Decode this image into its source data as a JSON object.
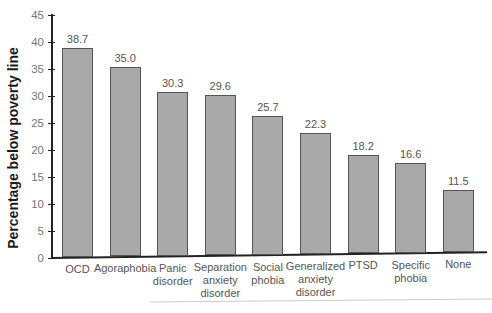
{
  "chart_data": {
    "type": "bar",
    "title": "",
    "xlabel": "",
    "ylabel": "Percentage below poverty line",
    "ylim": [
      0,
      45
    ],
    "yticks": [
      0,
      5,
      10,
      15,
      20,
      25,
      30,
      35,
      40,
      45
    ],
    "grid": false,
    "legend": null,
    "categories": [
      "OCD",
      "Agoraphobia",
      "Panic disorder",
      "Separation anxiety disorder",
      "Social phobia",
      "Generalized anxiety disorder",
      "PTSD",
      "Specific phobia",
      "None"
    ],
    "values": [
      38.7,
      35.0,
      30.3,
      29.6,
      25.7,
      22.3,
      18.2,
      16.6,
      11.5
    ],
    "value_labels": [
      "38.7",
      "35.0",
      "30.3",
      "29.6",
      "25.7",
      "22.3",
      "18.2",
      "16.6",
      "11.5"
    ],
    "category_lines": [
      [
        "OCD"
      ],
      [
        "Agoraphobia"
      ],
      [
        "Panic",
        "disorder"
      ],
      [
        "Separation",
        "anxiety",
        "disorder"
      ],
      [
        "Social",
        "phobia"
      ],
      [
        "Generalized",
        "anxiety",
        "disorder"
      ],
      [
        "PTSD"
      ],
      [
        "Specific",
        "phobia"
      ],
      [
        "None"
      ]
    ]
  },
  "colors": {
    "bar_fill": "#a9a9a9",
    "bar_edge": "#555555",
    "axis": "#222222"
  }
}
